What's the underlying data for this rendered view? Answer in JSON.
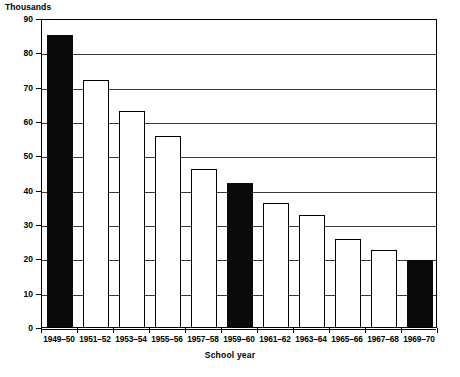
{
  "chart_data": {
    "type": "bar",
    "title": "",
    "subtitle": "",
    "unit_label": "Thousands",
    "xlabel": "School year",
    "ylabel": "",
    "ylim": [
      0,
      90
    ],
    "ytick_step": 10,
    "grid": true,
    "legend": null,
    "categories": [
      "1949–50",
      "1951–52",
      "1953–54",
      "1955–56",
      "1957–58",
      "1959–60",
      "1961–62",
      "1963–64",
      "1965–66",
      "1967–68",
      "1969–70"
    ],
    "values": [
      85,
      72,
      63,
      55.5,
      46,
      42,
      36,
      32.5,
      25.5,
      22.5,
      19.5
    ],
    "bar_styles": [
      "filled",
      "open",
      "open",
      "open",
      "open",
      "filled",
      "open",
      "open",
      "open",
      "open",
      "filled"
    ],
    "ytick_labels": [
      "90",
      "80",
      "70",
      "60",
      "50",
      "40",
      "30",
      "20",
      "10",
      "0"
    ],
    "ytick_values": [
      90,
      80,
      70,
      60,
      50,
      40,
      30,
      20,
      10,
      0
    ],
    "colors": {
      "filled_bar": "#0a0a0a",
      "open_bar": "#ffffff",
      "bar_outline": "#000000",
      "gridline": "#3a3a3a",
      "axis": "#000000",
      "background": "#ffffff",
      "text": "#000000"
    }
  }
}
